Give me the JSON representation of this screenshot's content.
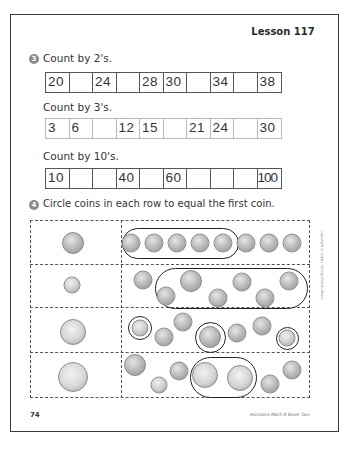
{
  "lesson": {
    "label": "Lesson 117"
  },
  "problem3": {
    "number": "3",
    "sections": [
      {
        "heading": "Count by 2's.",
        "style": "dark",
        "cells": [
          "20",
          "",
          "24",
          "",
          "28",
          "30",
          "",
          "34",
          "",
          "38"
        ]
      },
      {
        "heading": "Count by 3's.",
        "style": "light",
        "cells": [
          "3",
          "6",
          "",
          "12",
          "15",
          "",
          "21",
          "24",
          "",
          "30"
        ]
      },
      {
        "heading": "Count by 10's.",
        "style": "dark",
        "cells": [
          "10",
          "",
          "",
          "40",
          "",
          "60",
          "",
          "",
          "",
          "100"
        ]
      }
    ]
  },
  "problem4": {
    "number": "4",
    "instruction": "Circle coins in each row to equal the first coin.",
    "rows": [
      {
        "target": "nickel",
        "coins": [
          "penny",
          "penny",
          "penny",
          "penny",
          "penny",
          "penny",
          "penny",
          "penny"
        ],
        "circled": "first 5 pennies"
      },
      {
        "target": "dime",
        "coins": [
          "penny",
          "penny",
          "nickel",
          "penny",
          "penny",
          "penny",
          "penny"
        ],
        "circled": "nickel + 5 pennies"
      },
      {
        "target": "quarter",
        "coins": [
          "dime",
          "penny",
          "penny",
          "nickel",
          "penny",
          "penny",
          "dime"
        ],
        "circled": "dime, nickel, dime"
      },
      {
        "target": "half-dollar",
        "coins": [
          "nickel",
          "dime",
          "penny",
          "quarter",
          "quarter",
          "penny",
          "penny"
        ],
        "circled": "two quarters"
      }
    ]
  },
  "footer": {
    "page_number": "74",
    "book_title": "Horizons Math K Book Two",
    "copyright": "Copyright © Alpha Omega Publications"
  }
}
